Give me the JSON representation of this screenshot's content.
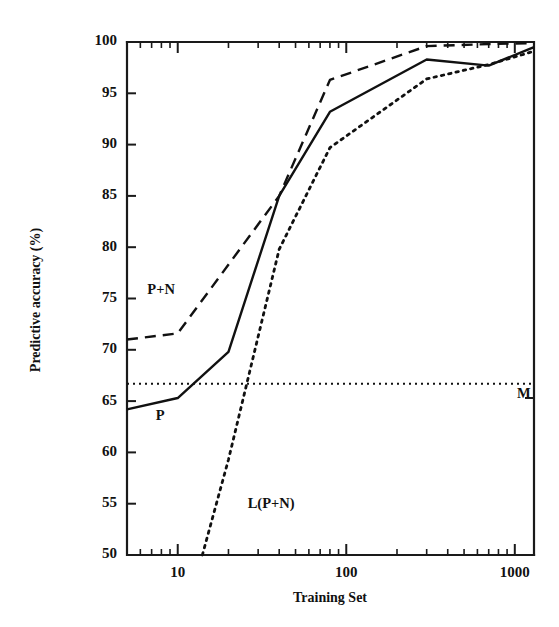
{
  "chart_data": {
    "type": "line",
    "title": "",
    "xlabel": "Training Set",
    "ylabel": "Predictive accuracy (%)",
    "xscale": "log",
    "yscale": "linear",
    "xlim": [
      5,
      1300
    ],
    "ylim": [
      50,
      100
    ],
    "grid": false,
    "legend": "inline-annotations",
    "xticks": [
      10,
      100,
      1000
    ],
    "xtick_labels": [
      "10",
      "100",
      "1000"
    ],
    "xticks_minor": [
      6,
      7,
      8,
      9,
      20,
      30,
      40,
      50,
      60,
      70,
      80,
      90,
      200,
      300,
      400,
      500,
      600,
      700,
      800,
      900
    ],
    "yticks": [
      50,
      55,
      60,
      65,
      70,
      75,
      80,
      85,
      90,
      95,
      100
    ],
    "ytick_labels": [
      "50",
      "55",
      "60",
      "65",
      "70",
      "75",
      "80",
      "85",
      "90",
      "95",
      "100"
    ],
    "series": [
      {
        "name": "P",
        "label": "P",
        "style": "solid",
        "x": [
          5,
          10,
          20,
          40,
          80,
          300,
          700,
          1300
        ],
        "values": [
          64.2,
          65.3,
          69.8,
          85.0,
          93.2,
          98.3,
          97.7,
          99.5
        ]
      },
      {
        "name": "P+N",
        "label": "P+N",
        "style": "dashed",
        "x": [
          5,
          10,
          40,
          80,
          300,
          700,
          1300
        ],
        "values": [
          71.0,
          71.6,
          85.0,
          96.3,
          99.6,
          99.8,
          99.9
        ]
      },
      {
        "name": "L(P+N)",
        "label": "L(P+N)",
        "style": "dotted",
        "x": [
          14,
          20,
          40,
          80,
          300,
          700,
          1300
        ],
        "values": [
          50.0,
          59.3,
          79.8,
          89.7,
          96.4,
          97.8,
          99.1
        ]
      },
      {
        "name": "M",
        "label": "M",
        "style": "fine-dotted-horizontal",
        "x": [
          5,
          1300
        ],
        "values": [
          66.7,
          66.7
        ]
      }
    ],
    "annotations": [
      {
        "text": "P+N",
        "x": 6.6,
        "y": 75.4
      },
      {
        "text": "P",
        "x": 7.4,
        "y": 63.2
      },
      {
        "text": "L(P+N)",
        "x": 26,
        "y": 54.6
      },
      {
        "text": "M",
        "x": 1030,
        "y": 65.3
      }
    ],
    "colors": {
      "axis": "#1a1a1a",
      "curve": "#111111",
      "background": "#ffffff"
    }
  }
}
